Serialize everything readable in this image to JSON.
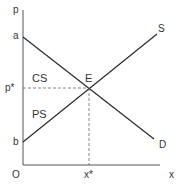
{
  "diagram": {
    "type": "supply-demand",
    "axes": {
      "y_label": "p",
      "x_label": "x",
      "origin_label": "O"
    },
    "points": {
      "demand_intercept": "a",
      "supply_intercept": "b",
      "equilibrium": "E",
      "equilibrium_price": "p*",
      "equilibrium_quantity": "x*"
    },
    "curves": {
      "supply": "S",
      "demand": "D"
    },
    "areas": {
      "consumer_surplus": "CS",
      "producer_surplus": "PS"
    },
    "colors": {
      "line": "#2a2a2a",
      "axis": "#555555",
      "dashed": "#666666",
      "text": "#333333"
    }
  }
}
